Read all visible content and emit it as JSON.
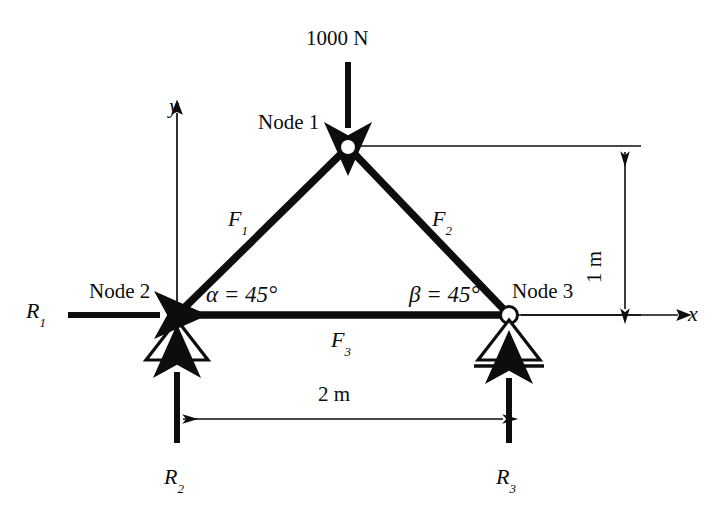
{
  "figure": {
    "type": "truss-free-body-diagram",
    "background_color": "#ffffff",
    "line_color": "#0d0d0d"
  },
  "loads": {
    "applied_load_label": "1000 N",
    "applied_load_value": 1000,
    "applied_load_unit": "N",
    "applied_load_direction": "down",
    "applied_load_at_node": "Node 1"
  },
  "nodes": [
    {
      "id": "node1",
      "label": "Node 1",
      "x_px": 348,
      "y_px": 147,
      "x_m": 1.0,
      "y_m": 1.0,
      "support": "none"
    },
    {
      "id": "node2",
      "label": "Node 2",
      "x_px": 177,
      "y_px": 315,
      "x_m": 0.0,
      "y_m": 0.0,
      "support": "pin"
    },
    {
      "id": "node3",
      "label": "Node 3",
      "x_px": 509,
      "y_px": 315,
      "x_m": 2.0,
      "y_m": 0.0,
      "support": "roller"
    }
  ],
  "members": [
    {
      "id": "member1",
      "label": "F",
      "subscript": "1",
      "from": "node2",
      "to": "node1"
    },
    {
      "id": "member2",
      "label": "F",
      "subscript": "2",
      "from": "node1",
      "to": "node3"
    },
    {
      "id": "member3",
      "label": "F",
      "subscript": "3",
      "from": "node2",
      "to": "node3"
    }
  ],
  "angles": [
    {
      "id": "alpha",
      "symbol": "α",
      "equals": "=",
      "value": "45",
      "unit": "°",
      "full": "α = 45°",
      "at_node": "Node 2"
    },
    {
      "id": "beta",
      "symbol": "β",
      "equals": "=",
      "value": "45",
      "unit": "°",
      "full": "β = 45°",
      "at_node": "Node 3"
    }
  ],
  "reactions": [
    {
      "id": "R1",
      "label": "R",
      "subscript": "1",
      "direction": "right",
      "at_node": "Node 2"
    },
    {
      "id": "R2",
      "label": "R",
      "subscript": "2",
      "direction": "up",
      "at_node": "Node 2"
    },
    {
      "id": "R3",
      "label": "R",
      "subscript": "3",
      "direction": "up",
      "at_node": "Node 3"
    }
  ],
  "dimensions": [
    {
      "id": "span",
      "label": "2 m",
      "value": 2,
      "unit": "m",
      "orientation": "horizontal",
      "between": [
        "Node 2",
        "Node 3"
      ]
    },
    {
      "id": "height",
      "label": "1 m",
      "value": 1,
      "unit": "m",
      "orientation": "vertical",
      "between": [
        "Node 3",
        "Node 1"
      ]
    }
  ],
  "axes": [
    {
      "id": "x-axis",
      "label": "x",
      "direction": "right"
    },
    {
      "id": "y-axis",
      "label": "y",
      "direction": "up"
    }
  ]
}
